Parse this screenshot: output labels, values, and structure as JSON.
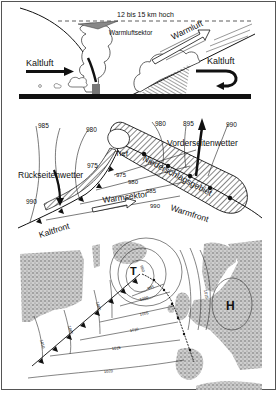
{
  "cross_section": {
    "height_label": "12 bis 15 km hoch",
    "warm_sector_label": "Warmluftsektor",
    "warm_air_label": "Warmluft",
    "cold_air_left": "Kaltluft",
    "cold_air_right": "Kaltluft"
  },
  "cyclone_schematic": {
    "isobars": [
      "985",
      "980",
      "975",
      "975",
      "980",
      "985",
      "990",
      "990",
      "960",
      "895",
      "990"
    ],
    "isobar_labels": {
      "a": "985",
      "b": "980",
      "c": "975",
      "d": "975",
      "e": "980",
      "f": "985",
      "g": "990",
      "h": "990",
      "i": "980",
      "j": "895",
      "k": "990"
    },
    "low_label": "Tief",
    "rear_weather": "Rückseitenwetter",
    "front_weather": "Vorderseitenwetter",
    "precip_area": "Niederschlagsgebiet",
    "warm_sector": "Warmsektor",
    "warm_front": "Warmfront",
    "cold_front": "Kaltfront"
  },
  "weather_map": {
    "low_symbol": "T",
    "high_symbol": "H",
    "isobar_labels": {
      "a": "990",
      "b": "995",
      "c": "1000",
      "d": "1005",
      "e": "1010",
      "f": "1015",
      "g": "1020",
      "h": "1010",
      "i": "1005",
      "j": "1000",
      "k": "1015"
    }
  }
}
